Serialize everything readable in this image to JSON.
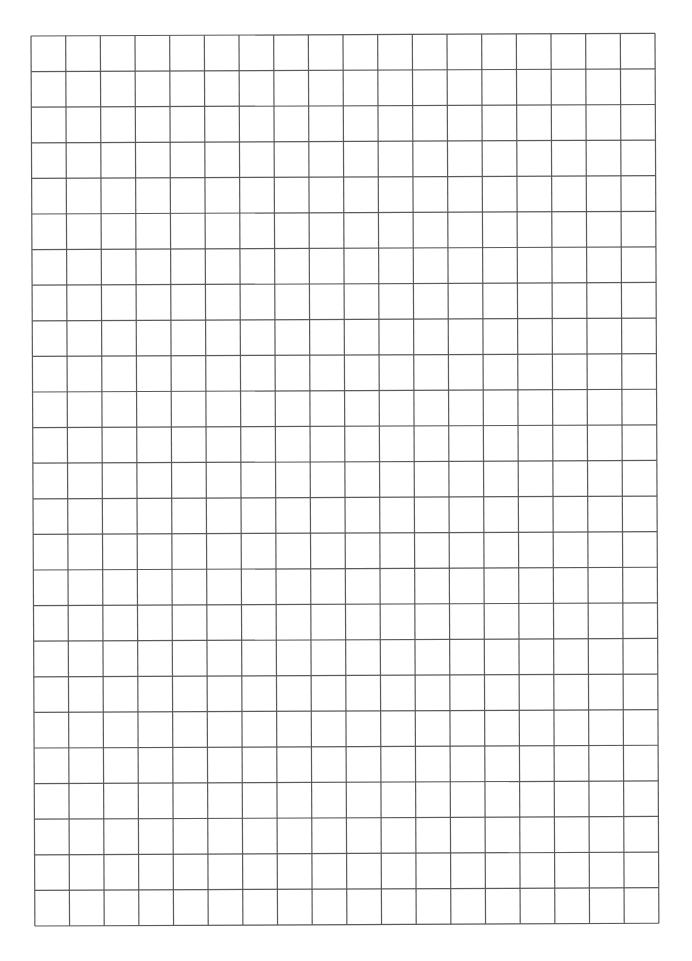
{
  "page": {
    "type": "graph-paper",
    "background_color": "#ffffff"
  },
  "grid": {
    "columns": 18,
    "rows": 25,
    "line_color": "#5a5a5a",
    "line_width": 1.2,
    "cell_width_px": 34.7,
    "cell_height_px": 35.6
  }
}
